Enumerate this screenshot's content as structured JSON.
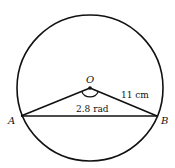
{
  "diagram": {
    "type": "circle-geometry",
    "circle": {
      "cx": 90,
      "cy": 88,
      "r": 73,
      "stroke": "#111111"
    },
    "points": {
      "O": {
        "label": "O",
        "x": 90,
        "y": 88
      },
      "A": {
        "label": "A",
        "x": 21,
        "y": 116
      },
      "B": {
        "label": "B",
        "x": 157,
        "y": 116
      }
    },
    "segments": [
      {
        "from": "O",
        "to": "A"
      },
      {
        "from": "O",
        "to": "B"
      },
      {
        "from": "A",
        "to": "B"
      }
    ],
    "annotations": {
      "radius_label": "11 cm",
      "angle_label": "2.8 rad"
    }
  }
}
